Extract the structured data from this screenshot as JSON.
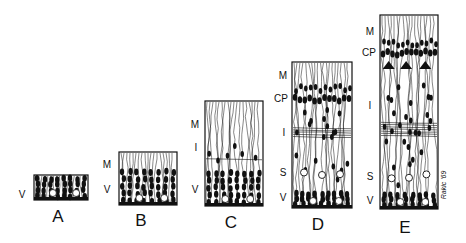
{
  "figure": {
    "signature": "Rakic '69",
    "ink_color": "#111111",
    "background": "#ffffff",
    "columns": [
      {
        "stage": "A",
        "x": 34,
        "y": 175,
        "w": 54,
        "h": 25,
        "layers": [
          "V"
        ],
        "label_pos": [
          {
            "t": "V",
            "x": 22,
            "y": 195
          }
        ],
        "stage_pos": {
          "x": 58,
          "y": 216
        }
      },
      {
        "stage": "B",
        "x": 119,
        "y": 152,
        "w": 58,
        "h": 53,
        "layers": [
          "M",
          "V"
        ],
        "label_pos": [
          {
            "t": "M",
            "x": 107,
            "y": 165
          },
          {
            "t": "V",
            "x": 107,
            "y": 190
          }
        ],
        "stage_pos": {
          "x": 141,
          "y": 220
        }
      },
      {
        "stage": "C",
        "x": 205,
        "y": 101,
        "w": 58,
        "h": 105,
        "layers": [
          "M",
          "I",
          "V"
        ],
        "label_pos": [
          {
            "t": "M",
            "x": 195,
            "y": 125
          },
          {
            "t": "I",
            "x": 196,
            "y": 148
          },
          {
            "t": "V",
            "x": 195,
            "y": 190
          }
        ],
        "stage_pos": {
          "x": 231,
          "y": 222
        }
      },
      {
        "stage": "D",
        "x": 292,
        "y": 62,
        "w": 60,
        "h": 146,
        "layers": [
          "M",
          "CP",
          "I",
          "S",
          "V"
        ],
        "label_pos": [
          {
            "t": "M",
            "x": 283,
            "y": 76
          },
          {
            "t": "CP",
            "x": 281,
            "y": 99
          },
          {
            "t": "I",
            "x": 284,
            "y": 133
          },
          {
            "t": "S",
            "x": 283,
            "y": 173
          },
          {
            "t": "V",
            "x": 283,
            "y": 198
          }
        ],
        "stage_pos": {
          "x": 318,
          "y": 224
        }
      },
      {
        "stage": "E",
        "x": 380,
        "y": 15,
        "w": 58,
        "h": 194,
        "layers": [
          "M",
          "CP",
          "I",
          "S",
          "V"
        ],
        "label_pos": [
          {
            "t": "M",
            "x": 370,
            "y": 32
          },
          {
            "t": "CP",
            "x": 369,
            "y": 53
          },
          {
            "t": "I",
            "x": 370,
            "y": 106
          },
          {
            "t": "S",
            "x": 370,
            "y": 177
          },
          {
            "t": "V",
            "x": 370,
            "y": 201
          }
        ],
        "stage_pos": {
          "x": 405,
          "y": 227
        }
      }
    ],
    "layer_legend": {
      "M": "Marginal zone",
      "CP": "Cortical plate",
      "I": "Intermediate zone",
      "S": "Subventricular zone",
      "V": "Ventricular zone"
    }
  }
}
